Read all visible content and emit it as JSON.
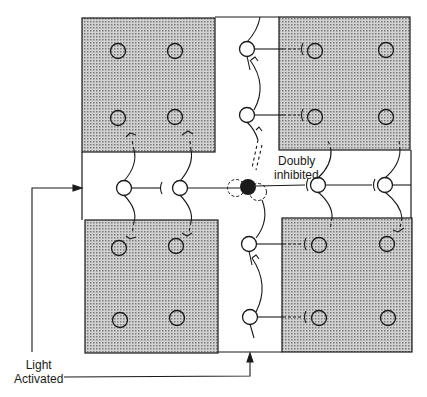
{
  "labels": {
    "doubly_inhibited_line1": "Doubly",
    "doubly_inhibited_line2": "inhibited",
    "light_line1": "Light",
    "light_line2": "Activated"
  },
  "colors": {
    "shade": "#b8b8b8",
    "stroke": "#1a1a1a",
    "filled_cell": "#1a1a1a",
    "background": "#ffffff"
  },
  "regions": {
    "shaded_blocks": [
      "top-left",
      "top-right",
      "bottom-left",
      "bottom-right"
    ],
    "light_strips": [
      "vertical-center",
      "horizontal-center"
    ]
  }
}
